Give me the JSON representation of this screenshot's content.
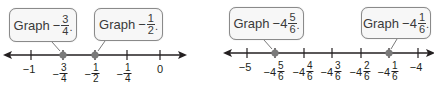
{
  "diagrams": [
    {
      "name": "left-number-line",
      "callouts": [
        {
          "word": "Graph",
          "sign": "−",
          "whole": "",
          "num": "3",
          "den": "4",
          "end": "."
        },
        {
          "word": "Graph",
          "sign": "−",
          "whole": "",
          "num": "1",
          "den": "2",
          "end": "."
        }
      ],
      "ticks": [
        {
          "sign": "−",
          "whole": "1",
          "num": "",
          "den": ""
        },
        {
          "sign": "−",
          "whole": "",
          "num": "3",
          "den": "4"
        },
        {
          "sign": "−",
          "whole": "",
          "num": "1",
          "den": "2"
        },
        {
          "sign": "−",
          "whole": "",
          "num": "1",
          "den": "4"
        },
        {
          "sign": "",
          "whole": "0",
          "num": "",
          "den": ""
        }
      ],
      "points": [
        "-3/4",
        "-1/2"
      ]
    },
    {
      "name": "right-number-line",
      "callouts": [
        {
          "word": "Graph",
          "sign": "−",
          "whole": "4",
          "num": "5",
          "den": "6",
          "end": "."
        },
        {
          "word": "Graph",
          "sign": "−",
          "whole": "4",
          "num": "1",
          "den": "6",
          "end": "."
        }
      ],
      "ticks": [
        {
          "sign": "−",
          "whole": "5",
          "num": "",
          "den": ""
        },
        {
          "sign": "−",
          "whole": "4",
          "num": "5",
          "den": "6"
        },
        {
          "sign": "−",
          "whole": "4",
          "num": "4",
          "den": "6"
        },
        {
          "sign": "−",
          "whole": "4",
          "num": "3",
          "den": "6"
        },
        {
          "sign": "−",
          "whole": "4",
          "num": "2",
          "den": "6"
        },
        {
          "sign": "−",
          "whole": "4",
          "num": "1",
          "den": "6"
        },
        {
          "sign": "−",
          "whole": "4",
          "num": "",
          "den": ""
        }
      ],
      "points": [
        "-4 5/6",
        "-4 1/6"
      ]
    }
  ],
  "colors": {
    "line": "#231f20",
    "point": "#7a7a7a",
    "callout_border": "#8a8a8a",
    "callout_bg": "#f7f7f7"
  }
}
